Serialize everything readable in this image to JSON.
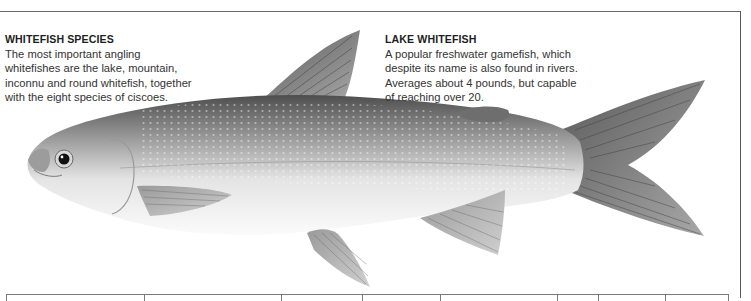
{
  "page": {
    "left_caption": {
      "title": "WHITEFISH SPECIES",
      "body": "The most important angling whitefishes are the lake, mountain, inconnu and round whitefish, together with the eight species of ciscoes."
    },
    "right_caption": {
      "title": "LAKE WHITEFISH",
      "body": "A popular freshwater gamefish, which despite its name is also found in rivers. Averages about 4 pounds, but capable of reaching over 20."
    },
    "illustration": {
      "subject": "lake-whitefish",
      "colors": {
        "back": "#5e5e5e",
        "flank": "#a8a8a8",
        "belly": "#f4f4f4",
        "fin": "#8c8c8c",
        "eye": "#111111"
      }
    },
    "table": {
      "column_separators_x": [
        137,
        274,
        355,
        433,
        550,
        591,
        658
      ]
    }
  }
}
